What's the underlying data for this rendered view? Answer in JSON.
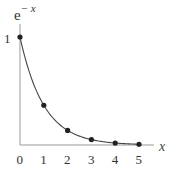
{
  "chart_data": {
    "type": "line",
    "title_base": "e",
    "title_exponent": "− x",
    "xlabel": "x",
    "ylabel": "",
    "x": [
      0,
      1,
      2,
      3,
      4,
      5
    ],
    "series": [
      {
        "name": "e^-x",
        "values": [
          1.0,
          0.368,
          0.135,
          0.05,
          0.018,
          0.007
        ],
        "markers": true,
        "curve": "smooth"
      }
    ],
    "xticks": [
      "0",
      "1",
      "2",
      "3",
      "4",
      "5"
    ],
    "yticks": [
      "1"
    ],
    "xlim": [
      0,
      5.6
    ],
    "ylim": [
      0,
      1.15
    ],
    "grid": false,
    "legend": "none",
    "colors": {
      "line": "#444444",
      "marker": "#222222",
      "axis": "#999999"
    }
  }
}
